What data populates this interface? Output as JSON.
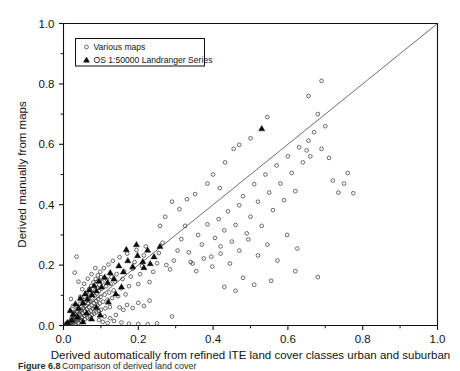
{
  "chart_data": {
    "type": "scatter",
    "title": "",
    "xlabel": "Derived automatically from refined ITE land cover classes urban and suburban",
    "ylabel": "Derived manually from maps",
    "xlim": [
      0.0,
      1.0
    ],
    "ylim": [
      0.0,
      1.0
    ],
    "xticks": [
      "0.0",
      "0.2",
      "0.4",
      "0.6",
      "0.8",
      "1.0"
    ],
    "yticks": [
      "0.0",
      "0.2",
      "0.4",
      "0.6",
      "0.8",
      "1.0"
    ],
    "xtick_values": [
      0.0,
      0.2,
      0.4,
      0.6,
      0.8,
      1.0
    ],
    "ytick_values": [
      0.0,
      0.2,
      0.4,
      0.6,
      0.8,
      1.0
    ],
    "minor_tick_interval": 0.1,
    "grid": false,
    "legend_position": "top-left",
    "reference_line": {
      "label": "1:1 line",
      "x": [
        0.0,
        1.0
      ],
      "y": [
        0.0,
        1.0
      ]
    },
    "series": [
      {
        "name": "Various maps",
        "marker": "open-circle",
        "color": "#3b3b3b",
        "points": [
          [
            0.005,
            0.004
          ],
          [
            0.008,
            0.006
          ],
          [
            0.01,
            0.003
          ],
          [
            0.012,
            0.01
          ],
          [
            0.014,
            0.005
          ],
          [
            0.016,
            0.013
          ],
          [
            0.018,
            0.008
          ],
          [
            0.02,
            0.018
          ],
          [
            0.021,
            0.004
          ],
          [
            0.022,
            0.026
          ],
          [
            0.023,
            0.011
          ],
          [
            0.024,
            0.033
          ],
          [
            0.025,
            0.007
          ],
          [
            0.026,
            0.02
          ],
          [
            0.027,
            0.043
          ],
          [
            0.028,
            0.015
          ],
          [
            0.029,
            0.029
          ],
          [
            0.03,
            0.006
          ],
          [
            0.031,
            0.038
          ],
          [
            0.032,
            0.022
          ],
          [
            0.033,
            0.053
          ],
          [
            0.034,
            0.012
          ],
          [
            0.035,
            0.031
          ],
          [
            0.036,
            0.046
          ],
          [
            0.037,
            0.019
          ],
          [
            0.038,
            0.063
          ],
          [
            0.039,
            0.027
          ],
          [
            0.04,
            0.009
          ],
          [
            0.041,
            0.04
          ],
          [
            0.042,
            0.055
          ],
          [
            0.043,
            0.023
          ],
          [
            0.044,
            0.072
          ],
          [
            0.045,
            0.035
          ],
          [
            0.046,
            0.016
          ],
          [
            0.047,
            0.049
          ],
          [
            0.048,
            0.061
          ],
          [
            0.049,
            0.028
          ],
          [
            0.05,
            0.085
          ],
          [
            0.051,
            0.041
          ],
          [
            0.052,
            0.013
          ],
          [
            0.053,
            0.057
          ],
          [
            0.054,
            0.07
          ],
          [
            0.055,
            0.032
          ],
          [
            0.056,
            0.096
          ],
          [
            0.057,
            0.047
          ],
          [
            0.058,
            0.021
          ],
          [
            0.059,
            0.065
          ],
          [
            0.06,
            0.079
          ],
          [
            0.061,
            0.037
          ],
          [
            0.062,
            0.108
          ],
          [
            0.063,
            0.053
          ],
          [
            0.064,
            0.026
          ],
          [
            0.065,
            0.074
          ],
          [
            0.066,
            0.088
          ],
          [
            0.067,
            0.043
          ],
          [
            0.068,
            0.119
          ],
          [
            0.069,
            0.06
          ],
          [
            0.07,
            0.03
          ],
          [
            0.071,
            0.082
          ],
          [
            0.072,
            0.098
          ],
          [
            0.073,
            0.049
          ],
          [
            0.074,
            0.131
          ],
          [
            0.075,
            0.067
          ],
          [
            0.076,
            0.035
          ],
          [
            0.077,
            0.09
          ],
          [
            0.078,
            0.107
          ],
          [
            0.079,
            0.055
          ],
          [
            0.08,
            0.143
          ],
          [
            0.081,
            0.074
          ],
          [
            0.082,
            0.039
          ],
          [
            0.083,
            0.098
          ],
          [
            0.084,
            0.116
          ],
          [
            0.085,
            0.061
          ],
          [
            0.086,
            0.154
          ],
          [
            0.087,
            0.081
          ],
          [
            0.088,
            0.044
          ],
          [
            0.089,
            0.106
          ],
          [
            0.09,
            0.125
          ],
          [
            0.091,
            0.067
          ],
          [
            0.092,
            0.166
          ],
          [
            0.093,
            0.088
          ],
          [
            0.094,
            0.048
          ],
          [
            0.095,
            0.114
          ],
          [
            0.096,
            0.134
          ],
          [
            0.097,
            0.073
          ],
          [
            0.098,
            0.178
          ],
          [
            0.099,
            0.095
          ],
          [
            0.1,
            0.052
          ],
          [
            0.102,
            0.122
          ],
          [
            0.104,
            0.143
          ],
          [
            0.106,
            0.079
          ],
          [
            0.108,
            0.19
          ],
          [
            0.11,
            0.102
          ],
          [
            0.112,
            0.057
          ],
          [
            0.114,
            0.13
          ],
          [
            0.116,
            0.152
          ],
          [
            0.118,
            0.085
          ],
          [
            0.12,
            0.202
          ],
          [
            0.122,
            0.109
          ],
          [
            0.124,
            0.061
          ],
          [
            0.126,
            0.138
          ],
          [
            0.128,
            0.161
          ],
          [
            0.13,
            0.091
          ],
          [
            0.132,
            0.214
          ],
          [
            0.134,
            0.116
          ],
          [
            0.138,
            0.146
          ],
          [
            0.142,
            0.17
          ],
          [
            0.146,
            0.097
          ],
          [
            0.15,
            0.226
          ],
          [
            0.154,
            0.123
          ],
          [
            0.158,
            0.154
          ],
          [
            0.162,
            0.179
          ],
          [
            0.166,
            0.103
          ],
          [
            0.17,
            0.238
          ],
          [
            0.175,
            0.13
          ],
          [
            0.18,
            0.162
          ],
          [
            0.185,
            0.188
          ],
          [
            0.19,
            0.21
          ],
          [
            0.195,
            0.25
          ],
          [
            0.2,
            0.137
          ],
          [
            0.205,
            0.17
          ],
          [
            0.21,
            0.197
          ],
          [
            0.215,
            0.232
          ],
          [
            0.22,
            0.262
          ],
          [
            0.23,
            0.144
          ],
          [
            0.24,
            0.178
          ],
          [
            0.25,
            0.206
          ],
          [
            0.255,
            0.24
          ],
          [
            0.265,
            0.274
          ],
          [
            0.275,
            0.2
          ],
          [
            0.285,
            0.186
          ],
          [
            0.295,
            0.215
          ],
          [
            0.305,
            0.248
          ],
          [
            0.315,
            0.286
          ],
          [
            0.325,
            0.33
          ],
          [
            0.15,
            0.06
          ],
          [
            0.16,
            0.052
          ],
          [
            0.17,
            0.068
          ],
          [
            0.185,
            0.058
          ],
          [
            0.2,
            0.075
          ],
          [
            0.215,
            0.065
          ],
          [
            0.23,
            0.082
          ],
          [
            0.11,
            0.03
          ],
          [
            0.125,
            0.024
          ],
          [
            0.14,
            0.035
          ],
          [
            0.095,
            0.018
          ],
          [
            0.105,
            0.012
          ],
          [
            0.118,
            0.008
          ],
          [
            0.135,
            0.015
          ],
          [
            0.155,
            0.01
          ],
          [
            0.175,
            0.006
          ],
          [
            0.2,
            0.005
          ],
          [
            0.225,
            0.004
          ],
          [
            0.25,
            0.007
          ],
          [
            0.29,
            0.03
          ],
          [
            0.03,
            0.175
          ],
          [
            0.035,
            0.228
          ],
          [
            0.04,
            0.145
          ],
          [
            0.045,
            0.095
          ],
          [
            0.05,
            0.12
          ],
          [
            0.02,
            0.088
          ],
          [
            0.025,
            0.065
          ],
          [
            0.055,
            0.138
          ],
          [
            0.06,
            0.108
          ],
          [
            0.065,
            0.155
          ],
          [
            0.07,
            0.122
          ],
          [
            0.075,
            0.17
          ],
          [
            0.085,
            0.19
          ],
          [
            0.09,
            0.145
          ],
          [
            0.1,
            0.16
          ],
          [
            0.335,
            0.242
          ],
          [
            0.345,
            0.205
          ],
          [
            0.36,
            0.3
          ],
          [
            0.37,
            0.268
          ],
          [
            0.385,
            0.335
          ],
          [
            0.395,
            0.228
          ],
          [
            0.405,
            0.29
          ],
          [
            0.415,
            0.352
          ],
          [
            0.42,
            0.262
          ],
          [
            0.43,
            0.315
          ],
          [
            0.44,
            0.378
          ],
          [
            0.45,
            0.278
          ],
          [
            0.46,
            0.333
          ],
          [
            0.47,
            0.398
          ],
          [
            0.48,
            0.428
          ],
          [
            0.49,
            0.305
          ],
          [
            0.5,
            0.36
          ],
          [
            0.51,
            0.468
          ],
          [
            0.52,
            0.41
          ],
          [
            0.53,
            0.33
          ],
          [
            0.54,
            0.5
          ],
          [
            0.55,
            0.44
          ],
          [
            0.56,
            0.382
          ],
          [
            0.57,
            0.53
          ],
          [
            0.58,
            0.47
          ],
          [
            0.59,
            0.415
          ],
          [
            0.6,
            0.56
          ],
          [
            0.61,
            0.505
          ],
          [
            0.62,
            0.445
          ],
          [
            0.63,
            0.59
          ],
          [
            0.64,
            0.54
          ],
          [
            0.65,
            0.58
          ],
          [
            0.655,
            0.612
          ],
          [
            0.66,
            0.56
          ],
          [
            0.67,
            0.64
          ],
          [
            0.68,
            0.7
          ],
          [
            0.69,
            0.585
          ],
          [
            0.7,
            0.66
          ],
          [
            0.71,
            0.555
          ],
          [
            0.69,
            0.81
          ],
          [
            0.655,
            0.76
          ],
          [
            0.545,
            0.69
          ],
          [
            0.5,
            0.62
          ],
          [
            0.47,
            0.598
          ],
          [
            0.455,
            0.585
          ],
          [
            0.72,
            0.48
          ],
          [
            0.735,
            0.44
          ],
          [
            0.75,
            0.47
          ],
          [
            0.76,
            0.505
          ],
          [
            0.775,
            0.438
          ],
          [
            0.385,
            0.47
          ],
          [
            0.4,
            0.5
          ],
          [
            0.418,
            0.455
          ],
          [
            0.432,
            0.54
          ],
          [
            0.352,
            0.435
          ],
          [
            0.33,
            0.418
          ],
          [
            0.31,
            0.385
          ],
          [
            0.29,
            0.41
          ],
          [
            0.272,
            0.36
          ],
          [
            0.258,
            0.33
          ],
          [
            0.625,
            0.255
          ],
          [
            0.598,
            0.3
          ],
          [
            0.572,
            0.215
          ],
          [
            0.545,
            0.268
          ],
          [
            0.52,
            0.232
          ],
          [
            0.494,
            0.285
          ],
          [
            0.47,
            0.248
          ],
          [
            0.445,
            0.205
          ],
          [
            0.42,
            0.238
          ],
          [
            0.398,
            0.195
          ],
          [
            0.375,
            0.222
          ],
          [
            0.355,
            0.18
          ],
          [
            0.34,
            0.21
          ],
          [
            0.62,
            0.18
          ],
          [
            0.68,
            0.16
          ],
          [
            0.48,
            0.158
          ],
          [
            0.51,
            0.135
          ],
          [
            0.555,
            0.148
          ],
          [
            0.43,
            0.128
          ],
          [
            0.46,
            0.115
          ]
        ]
      },
      {
        "name": "OS 1:50000 Landranger Series",
        "marker": "filled-triangle",
        "color": "#0a0a0a",
        "points": [
          [
            0.018,
            0.05
          ],
          [
            0.026,
            0.038
          ],
          [
            0.032,
            0.072
          ],
          [
            0.04,
            0.058
          ],
          [
            0.045,
            0.09
          ],
          [
            0.052,
            0.075
          ],
          [
            0.058,
            0.105
          ],
          [
            0.064,
            0.088
          ],
          [
            0.07,
            0.118
          ],
          [
            0.076,
            0.102
          ],
          [
            0.082,
            0.132
          ],
          [
            0.088,
            0.115
          ],
          [
            0.095,
            0.148
          ],
          [
            0.102,
            0.128
          ],
          [
            0.11,
            0.16
          ],
          [
            0.118,
            0.142
          ],
          [
            0.125,
            0.175
          ],
          [
            0.135,
            0.155
          ],
          [
            0.148,
            0.198
          ],
          [
            0.16,
            0.178
          ],
          [
            0.172,
            0.215
          ],
          [
            0.185,
            0.195
          ],
          [
            0.198,
            0.232
          ],
          [
            0.212,
            0.212
          ],
          [
            0.225,
            0.25
          ],
          [
            0.242,
            0.228
          ],
          [
            0.258,
            0.262
          ],
          [
            0.168,
            0.252
          ],
          [
            0.195,
            0.268
          ],
          [
            0.12,
            0.078
          ],
          [
            0.088,
            0.06
          ],
          [
            0.062,
            0.042
          ],
          [
            0.038,
            0.028
          ],
          [
            0.022,
            0.018
          ],
          [
            0.01,
            0.01
          ],
          [
            0.53,
            0.652
          ],
          [
            0.052,
            0.012
          ],
          [
            0.075,
            0.022
          ],
          [
            0.098,
            0.035
          ],
          [
            0.14,
            0.105
          ],
          [
            0.155,
            0.128
          ],
          [
            0.215,
            0.192
          ],
          [
            0.232,
            0.205
          ]
        ]
      }
    ]
  },
  "legend": {
    "items": [
      {
        "label": "Various maps",
        "marker": "open-circle"
      },
      {
        "label": "OS 1:50000 Landranger Series",
        "marker": "filled-triangle"
      }
    ]
  },
  "caption": {
    "prefix": "Figure 6.8",
    "text": "Comparison of derived land cover"
  }
}
